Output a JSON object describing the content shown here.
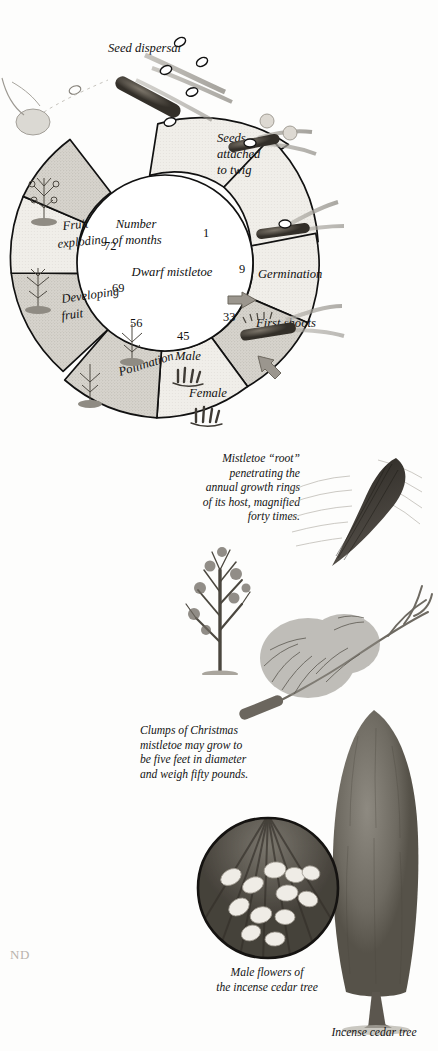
{
  "page": {
    "background": "#fdfdfc",
    "width": 438,
    "height": 1051
  },
  "cycle_diagram": {
    "title_center": "Dwarf mistletoe",
    "axis_caption_line1": "Number",
    "axis_caption_line2": "of months",
    "month_numbers": [
      "1",
      "9",
      "33",
      "45",
      "56",
      "69",
      "72"
    ],
    "stage_labels": {
      "seed_dispersal": "Seed dispersal",
      "seeds_attached_line1": "Seeds",
      "seeds_attached_line2": "attached",
      "seeds_attached_line3": "to twig",
      "germination": "Germination",
      "first_shoots": "First shoots",
      "male": "Male",
      "female": "Female",
      "pollination": "Pollination",
      "developing_fruit_line1": "Developing",
      "developing_fruit_line2": "fruit",
      "fruit_exploding_line1": "Fruit",
      "fruit_exploding_line2": "exploding"
    }
  },
  "captions": {
    "root": "Mistletoe “root”\npenetrating the\nannual growth rings\nof its host, magnified\nforty times.",
    "clumps": "Clumps of Christmas\nmistletoe may grow to\nbe five feet in diameter\nand weigh fifty pounds.",
    "male_flowers": "Male flowers of\nthe incense cedar tree",
    "incense_cedar": "Incense cedar tree"
  },
  "body_text": {
    "para1": "on, it usually\ning out any\ntiny, closed\nat these first",
    "para2": "ring the late\nMistletoe is\nntil a nearby\nn. For some\nars.",
    "para3": "ns only one\ns perfect for\nhat transport\ned when the",
    "para4": "ic germs are\ney both wait\nntlessly feed\nnistic germs,\nThe feeding\nakness and\nosts die, the\nntinue their",
    "section_heading": "ND",
    "para5": "e destructive\nne mistletoe\nar-old cedar"
  },
  "colors": {
    "ring_light": "#eeece7",
    "ring_dark": "#ccc9c2",
    "ring_stroke": "#111111",
    "heading": "#b9b3ad",
    "text": "#1a1a1a"
  }
}
